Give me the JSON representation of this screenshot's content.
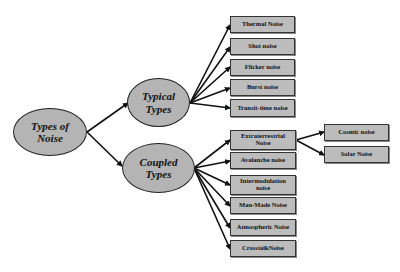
{
  "diagram": {
    "root": {
      "label_line1": "Types of",
      "label_line2": "Noise"
    },
    "typical": {
      "label_line1": "Typical",
      "label_line2": "Types",
      "children": [
        "Thermal Noise",
        "Shot noise",
        "Flicker noise",
        "Burst noise",
        "Transit-time noise"
      ]
    },
    "coupled": {
      "label_line1": "Coupled",
      "label_line2": "Types",
      "children": [
        {
          "line1": "Extraterrestrial",
          "line2": "Noise"
        },
        {
          "line1": "Avalanche noise",
          "line2": ""
        },
        {
          "line1": "Intermodulation",
          "line2": "noise"
        },
        {
          "line1": "Man-Made Noise",
          "line2": ""
        },
        {
          "line1": "Atmospheric Noise",
          "line2": ""
        },
        {
          "line1": "CrosstalkNoise",
          "line2": ""
        }
      ]
    },
    "extraterrestrial": {
      "children": [
        "Cosmic noise",
        "Solar Noise"
      ]
    },
    "colors": {
      "node_fill": "#b4b4b4",
      "box_fill": "#bcbcbc",
      "line": "#111111"
    }
  }
}
